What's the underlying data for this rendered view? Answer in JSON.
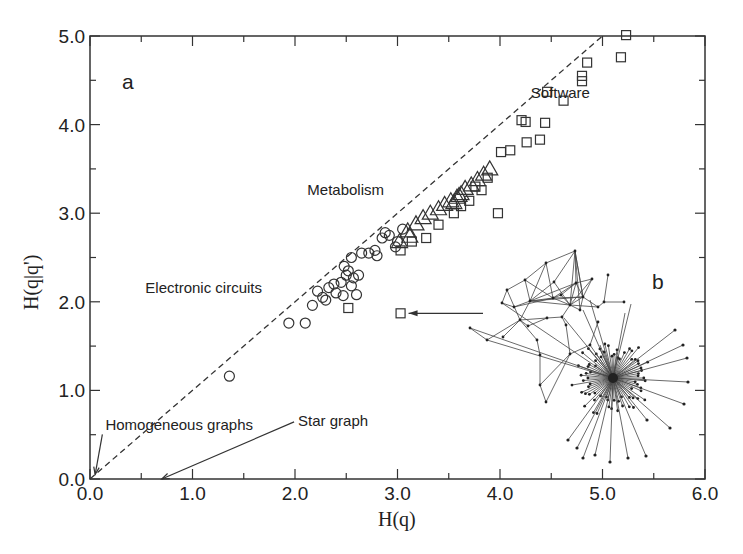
{
  "chart_data": {
    "type": "scatter",
    "title": "",
    "xlabel": "H(q)",
    "ylabel": "H(q|q')",
    "xlim": [
      0.0,
      6.0
    ],
    "ylim": [
      0.0,
      5.0
    ],
    "grid": false,
    "x_ticks": [
      "0.0",
      "1.0",
      "2.0",
      "3.0",
      "4.0",
      "5.0",
      "6.0"
    ],
    "y_ticks": [
      "0.0",
      "1.0",
      "2.0",
      "3.0",
      "4.0",
      "5.0"
    ],
    "reference_line": {
      "label": "y = x",
      "style": "dashed",
      "from": [
        0,
        0
      ],
      "to": [
        5.0,
        5.0
      ]
    },
    "panel_labels": {
      "a": "a",
      "b": "b"
    },
    "series": [
      {
        "name": "Electronic circuits",
        "marker": "circle",
        "points": [
          [
            1.36,
            1.16
          ],
          [
            1.94,
            1.76
          ],
          [
            2.1,
            1.76
          ],
          [
            2.17,
            1.96
          ],
          [
            2.22,
            2.12
          ],
          [
            2.27,
            2.05
          ],
          [
            2.3,
            2.02
          ],
          [
            2.33,
            2.16
          ],
          [
            2.38,
            2.2
          ],
          [
            2.4,
            2.1
          ],
          [
            2.45,
            2.22
          ],
          [
            2.47,
            2.07
          ],
          [
            2.5,
            2.3
          ],
          [
            2.52,
            2.35
          ],
          [
            2.55,
            2.18
          ],
          [
            2.57,
            2.27
          ],
          [
            2.6,
            2.08
          ],
          [
            2.62,
            2.3
          ],
          [
            2.48,
            2.4
          ],
          [
            2.55,
            2.5
          ],
          [
            2.65,
            2.55
          ],
          [
            2.72,
            2.55
          ],
          [
            2.78,
            2.58
          ],
          [
            2.8,
            2.52
          ],
          [
            2.85,
            2.72
          ],
          [
            2.88,
            2.78
          ],
          [
            2.92,
            2.75
          ],
          [
            3.0,
            2.68
          ],
          [
            3.05,
            2.82
          ],
          [
            2.98,
            2.62
          ]
        ]
      },
      {
        "name": "Metabolism",
        "marker": "triangle",
        "points": [
          [
            3.02,
            2.68
          ],
          [
            3.1,
            2.8
          ],
          [
            3.18,
            2.88
          ],
          [
            3.25,
            2.95
          ],
          [
            3.32,
            3.0
          ],
          [
            3.4,
            3.05
          ],
          [
            3.46,
            3.1
          ],
          [
            3.52,
            3.14
          ],
          [
            3.58,
            3.18
          ],
          [
            3.62,
            3.22
          ],
          [
            3.66,
            3.28
          ],
          [
            3.72,
            3.32
          ],
          [
            3.78,
            3.38
          ],
          [
            3.84,
            3.44
          ],
          [
            3.9,
            3.5
          ],
          [
            3.55,
            3.12
          ],
          [
            3.6,
            3.2
          ],
          [
            3.12,
            2.74
          ]
        ]
      },
      {
        "name": "Software",
        "marker": "square",
        "points": [
          [
            2.52,
            1.93
          ],
          [
            3.03,
            1.87
          ],
          [
            3.03,
            2.58
          ],
          [
            3.14,
            2.68
          ],
          [
            3.28,
            2.72
          ],
          [
            3.4,
            2.87
          ],
          [
            3.55,
            3.0
          ],
          [
            3.62,
            3.08
          ],
          [
            3.7,
            3.14
          ],
          [
            3.76,
            3.3
          ],
          [
            3.82,
            3.26
          ],
          [
            3.88,
            3.4
          ],
          [
            3.98,
            3.0
          ],
          [
            4.01,
            3.69
          ],
          [
            4.1,
            3.71
          ],
          [
            4.26,
            3.8
          ],
          [
            4.39,
            3.83
          ],
          [
            4.21,
            4.05
          ],
          [
            4.25,
            4.03
          ],
          [
            4.44,
            4.02
          ],
          [
            4.46,
            4.37
          ],
          [
            4.62,
            4.27
          ],
          [
            4.8,
            4.55
          ],
          [
            4.8,
            4.49
          ],
          [
            4.85,
            4.7
          ],
          [
            5.18,
            4.76
          ],
          [
            5.23,
            5.01
          ]
        ]
      }
    ],
    "annotations": [
      {
        "text": "Software",
        "x": 4.3,
        "y": 4.3
      },
      {
        "text": "Metabolism",
        "x": 2.12,
        "y": 3.2
      },
      {
        "text": "Electronic circuits",
        "x": 0.54,
        "y": 2.1
      },
      {
        "text": "Homogeneous graphs",
        "x": 0.15,
        "y": 0.55,
        "arrow_to": [
          0.05,
          0.05
        ]
      },
      {
        "text": "Star graph",
        "x": 2.03,
        "y": 0.6,
        "arrow_to": [
          0.7,
          0.0
        ]
      }
    ],
    "inset": {
      "label": "b",
      "description": "network diagram: dense cluster connected to a star-like hub",
      "arrow_to_point": [
        3.03,
        1.87
      ]
    }
  }
}
